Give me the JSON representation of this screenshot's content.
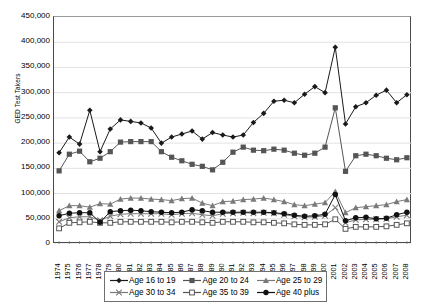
{
  "chart_data": {
    "type": "line",
    "title": "",
    "xlabel": "",
    "ylabel": "GED Test Takers",
    "ylim": [
      0,
      450000
    ],
    "ytick_step": 50000,
    "grid": true,
    "legend_position": "bottom",
    "ytick_labels": [
      "450,000",
      "400,000",
      "350,000",
      "300,000",
      "250,000",
      "200,000",
      "150,000",
      "100,000",
      "50,000",
      "0"
    ],
    "categories": [
      "1974",
      "1975",
      "1976",
      "1977",
      "1978",
      "1979",
      "1980",
      "1981",
      "1982",
      "1983",
      "1984",
      "1985",
      "1986",
      "1987",
      "1988",
      "1989",
      "1990",
      "1991",
      "1992",
      "1993",
      "1994",
      "1995",
      "1996",
      "1997",
      "1998",
      "1999",
      "2000",
      "2001",
      "2002",
      "2003",
      "2004",
      "2005",
      "2006",
      "2007",
      "2008"
    ],
    "series": [
      {
        "name": "Age 16 to 19",
        "marker": "diamond",
        "color": "#1a1a1a",
        "values": [
          181000,
          212000,
          198000,
          265000,
          183000,
          228000,
          246000,
          243000,
          240000,
          230000,
          200000,
          212000,
          218000,
          224000,
          208000,
          221000,
          216000,
          212000,
          216000,
          241000,
          259000,
          283000,
          285000,
          280000,
          297000,
          312000,
          300000,
          390000,
          238000,
          272000,
          280000,
          295000,
          305000,
          280000,
          296000
        ]
      },
      {
        "name": "Age 20 to 24",
        "marker": "square-filled",
        "color": "#555555",
        "values": [
          145000,
          178000,
          184000,
          163000,
          170000,
          183000,
          202000,
          203000,
          203000,
          203000,
          183000,
          172000,
          165000,
          158000,
          154000,
          147000,
          162000,
          182000,
          192000,
          186000,
          185000,
          188000,
          186000,
          180000,
          176000,
          180000,
          192000,
          270000,
          144000,
          175000,
          178000,
          175000,
          170000,
          167000,
          171000
        ]
      },
      {
        "name": "Age 25 to 29",
        "marker": "triangle",
        "color": "#7a7a7a",
        "values": [
          66000,
          76000,
          76000,
          73000,
          80000,
          79000,
          89000,
          91000,
          91000,
          89000,
          88000,
          86000,
          90000,
          91000,
          81000,
          76000,
          84000,
          85000,
          88000,
          89000,
          91000,
          88000,
          84000,
          78000,
          76000,
          79000,
          82000,
          104000,
          62000,
          72000,
          74000,
          76000,
          78000,
          84000,
          88000
        ]
      },
      {
        "name": "Age 30 to 34",
        "marker": "cross",
        "color": "#7a7a7a",
        "values": [
          44000,
          52000,
          54000,
          54000,
          47000,
          55000,
          59000,
          60000,
          60000,
          60000,
          60000,
          58000,
          60000,
          61000,
          58000,
          56000,
          60000,
          61000,
          62000,
          61000,
          62000,
          61000,
          58000,
          55000,
          53000,
          54000,
          56000,
          72000,
          42000,
          48000,
          49000,
          49000,
          50000,
          54000,
          57000
        ]
      },
      {
        "name": "Age 35 to 39",
        "marker": "square-open",
        "color": "#555555",
        "values": [
          31000,
          42000,
          43000,
          44000,
          42000,
          42000,
          44000,
          44000,
          44000,
          44000,
          44000,
          43000,
          44000,
          44000,
          43000,
          42000,
          44000,
          44000,
          44000,
          43000,
          43000,
          42000,
          41000,
          39000,
          38000,
          38000,
          39000,
          49000,
          30000,
          34000,
          34000,
          34000,
          35000,
          38000,
          41000
        ]
      },
      {
        "name": "Age 40 plus",
        "marker": "circle-filled",
        "color": "#111111",
        "values": [
          56000,
          61000,
          62000,
          62000,
          43000,
          64000,
          66000,
          67000,
          66000,
          64000,
          63000,
          62000,
          63000,
          68000,
          66000,
          63000,
          63000,
          63000,
          63000,
          63000,
          63000,
          62000,
          60000,
          57000,
          55000,
          56000,
          59000,
          98000,
          46000,
          52000,
          53000,
          50000,
          51000,
          58000,
          63000
        ]
      }
    ]
  },
  "legend": {
    "items": [
      {
        "label": "Age 16 to 19"
      },
      {
        "label": "Age 20 to 24"
      },
      {
        "label": "Age 25 to 29"
      },
      {
        "label": "Age 30 to 34"
      },
      {
        "label": "Age 35 to 39"
      },
      {
        "label": "Age 40 plus"
      }
    ]
  }
}
